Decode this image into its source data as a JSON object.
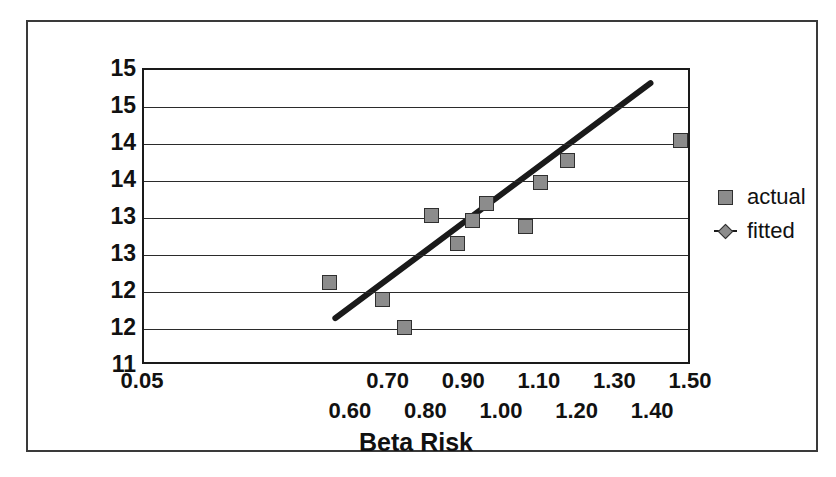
{
  "chart_data": {
    "type": "scatter",
    "title": "",
    "xlabel": "Beta Risk",
    "ylabel": "% Expected Return",
    "xlim": [
      0.05,
      1.5
    ],
    "ylim": [
      11.0,
      15.0
    ],
    "grid": true,
    "legend_position": "right",
    "y_ticks": [
      {
        "value": 15.0,
        "label": "15"
      },
      {
        "value": 14.5,
        "label": "15"
      },
      {
        "value": 14.0,
        "label": "14"
      },
      {
        "value": 13.5,
        "label": "14"
      },
      {
        "value": 13.0,
        "label": "13"
      },
      {
        "value": 12.5,
        "label": "13"
      },
      {
        "value": 12.0,
        "label": "12"
      },
      {
        "value": 11.5,
        "label": "12"
      },
      {
        "value": 11.0,
        "label": "11"
      }
    ],
    "x_ticks": [
      {
        "value": 0.05,
        "label": "0.05",
        "row": 0
      },
      {
        "value": 0.6,
        "label": "0.60",
        "row": 1
      },
      {
        "value": 0.7,
        "label": "0.70",
        "row": 0
      },
      {
        "value": 0.8,
        "label": "0.80",
        "row": 1
      },
      {
        "value": 0.9,
        "label": "0.90",
        "row": 0
      },
      {
        "value": 1.0,
        "label": "1.00",
        "row": 1
      },
      {
        "value": 1.1,
        "label": "1.10",
        "row": 0
      },
      {
        "value": 1.2,
        "label": "1.20",
        "row": 1
      },
      {
        "value": 1.3,
        "label": "1.30",
        "row": 0
      },
      {
        "value": 1.4,
        "label": "1.40",
        "row": 1
      },
      {
        "value": 1.5,
        "label": "1.50",
        "row": 0
      }
    ],
    "series": [
      {
        "name": "actual",
        "marker": "square",
        "color": "#8c8c8c",
        "points": [
          {
            "x": 0.54,
            "y": 12.13
          },
          {
            "x": 0.68,
            "y": 11.9
          },
          {
            "x": 0.74,
            "y": 11.52
          },
          {
            "x": 0.81,
            "y": 13.03
          },
          {
            "x": 0.88,
            "y": 12.66
          },
          {
            "x": 0.92,
            "y": 12.97
          },
          {
            "x": 0.955,
            "y": 13.19
          },
          {
            "x": 1.06,
            "y": 12.89
          },
          {
            "x": 1.1,
            "y": 13.48
          },
          {
            "x": 1.17,
            "y": 13.78
          },
          {
            "x": 1.47,
            "y": 14.05
          }
        ]
      },
      {
        "name": "fitted",
        "marker": "diamond",
        "color": "#1a1a1a",
        "line": {
          "x1": 0.56,
          "y1": 11.6,
          "x2": 1.4,
          "y2": 14.82
        }
      }
    ]
  },
  "legend": {
    "items": [
      {
        "label": "actual",
        "marker": "square"
      },
      {
        "label": "fitted",
        "marker": "diamond"
      }
    ]
  },
  "axes": {
    "x_title": "Beta Risk",
    "y_title": "% Expected Return"
  }
}
